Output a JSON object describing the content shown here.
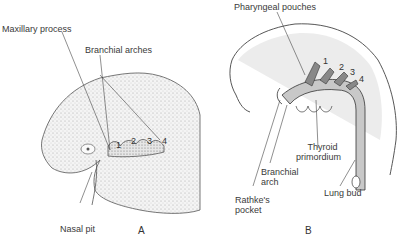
{
  "figure_a": {
    "caption": "A",
    "labels": {
      "maxillary_process": "Maxillary process",
      "branchial_arches": "Branchial arches",
      "nasal_pit": "Nasal pit"
    },
    "arch_numbers": [
      "1",
      "2",
      "3",
      "4"
    ]
  },
  "figure_b": {
    "caption": "B",
    "labels": {
      "pharyngeal_pouches": "Pharyngeal pouches",
      "thyroid_primordium_line1": "Thyroid",
      "thyroid_primordium_line2": "primordium",
      "branchial_arch_line1": "Branchial",
      "branchial_arch_line2": "arch",
      "rathkes_pocket_line1": "Rathke's",
      "rathkes_pocket_line2": "pocket",
      "lung_bud": "Lung bud"
    },
    "pouch_numbers": [
      "1",
      "2",
      "3",
      "4"
    ]
  }
}
